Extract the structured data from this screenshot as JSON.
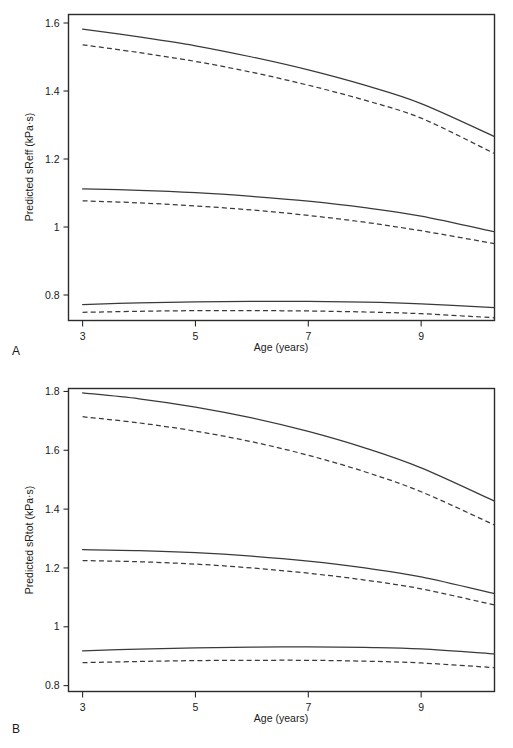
{
  "figure": {
    "panels": [
      {
        "letter": "A",
        "xlabel": "Age (years)",
        "ylabel": "Predicted sReff (kPa·s)",
        "xticks": [
          "3",
          "5",
          "7",
          "9"
        ],
        "yticks": [
          "0.8",
          "1",
          "1.2",
          "1.4",
          "1.6"
        ]
      },
      {
        "letter": "B",
        "xlabel": "Age (years)",
        "ylabel": "Predicted sRtot (kPa·s)",
        "xticks": [
          "3",
          "5",
          "7",
          "9"
        ],
        "yticks": [
          "0.8",
          "1",
          "1.2",
          "1.4",
          "1.6",
          "1.8"
        ]
      }
    ]
  },
  "chart_data": [
    {
      "type": "line",
      "title": "",
      "panel": "A",
      "xlabel": "Age (years)",
      "ylabel": "Predicted sReff (kPa·s)",
      "xlim": [
        2.75,
        10.3
      ],
      "ylim": [
        0.725,
        1.625
      ],
      "xticks": [
        3,
        5,
        7,
        9
      ],
      "yticks": [
        0.8,
        1,
        1.2,
        1.4,
        1.6
      ],
      "grid": false,
      "legend": "none",
      "x": [
        3,
        4,
        5,
        6,
        7,
        8,
        9,
        10.3
      ],
      "series": [
        {
          "name": "upper-percentile-solid",
          "style": "solid",
          "values": [
            1.582,
            1.559,
            1.533,
            1.5,
            1.462,
            1.417,
            1.363,
            1.266
          ]
        },
        {
          "name": "upper-percentile-dashed",
          "style": "dashed",
          "values": [
            1.536,
            1.513,
            1.487,
            1.455,
            1.417,
            1.373,
            1.32,
            1.216
          ]
        },
        {
          "name": "median-solid",
          "style": "solid",
          "values": [
            1.112,
            1.108,
            1.101,
            1.09,
            1.076,
            1.057,
            1.032,
            0.986
          ]
        },
        {
          "name": "median-dashed",
          "style": "dashed",
          "values": [
            1.077,
            1.071,
            1.062,
            1.05,
            1.034,
            1.014,
            0.989,
            0.951
          ]
        },
        {
          "name": "lower-percentile-solid",
          "style": "solid",
          "values": [
            0.772,
            0.777,
            0.78,
            0.781,
            0.781,
            0.779,
            0.774,
            0.763
          ]
        },
        {
          "name": "lower-percentile-dashed",
          "style": "dashed",
          "values": [
            0.749,
            0.752,
            0.754,
            0.754,
            0.753,
            0.75,
            0.745,
            0.733
          ]
        }
      ]
    },
    {
      "type": "line",
      "title": "",
      "panel": "B",
      "xlabel": "Age (years)",
      "ylabel": "Predicted sRtot (kPa·s)",
      "xlim": [
        2.75,
        10.3
      ],
      "ylim": [
        0.78,
        1.81
      ],
      "xticks": [
        3,
        5,
        7,
        9
      ],
      "yticks": [
        0.8,
        1,
        1.2,
        1.4,
        1.6,
        1.8
      ],
      "grid": false,
      "legend": "none",
      "x": [
        3,
        4,
        5,
        6,
        7,
        8,
        9,
        10.3
      ],
      "series": [
        {
          "name": "upper-percentile-solid",
          "style": "solid",
          "values": [
            1.795,
            1.775,
            1.747,
            1.71,
            1.664,
            1.608,
            1.54,
            1.427
          ]
        },
        {
          "name": "upper-percentile-dashed",
          "style": "dashed",
          "values": [
            1.714,
            1.693,
            1.665,
            1.629,
            1.583,
            1.527,
            1.459,
            1.346
          ]
        },
        {
          "name": "median-solid",
          "style": "solid",
          "values": [
            1.262,
            1.259,
            1.252,
            1.24,
            1.223,
            1.2,
            1.17,
            1.113
          ]
        },
        {
          "name": "median-dashed",
          "style": "dashed",
          "values": [
            1.225,
            1.221,
            1.213,
            1.2,
            1.182,
            1.159,
            1.129,
            1.074
          ]
        },
        {
          "name": "lower-percentile-solid",
          "style": "solid",
          "values": [
            0.918,
            0.924,
            0.928,
            0.931,
            0.932,
            0.93,
            0.925,
            0.908
          ]
        },
        {
          "name": "lower-percentile-dashed",
          "style": "dashed",
          "values": [
            0.878,
            0.882,
            0.885,
            0.886,
            0.886,
            0.883,
            0.877,
            0.861
          ]
        }
      ]
    }
  ]
}
